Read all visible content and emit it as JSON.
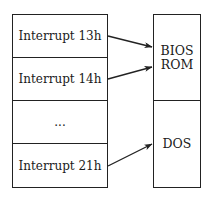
{
  "left_table": {
    "rows": [
      {
        "label": "Interrupt 13h"
      },
      {
        "label": "Interrupt 14h"
      },
      {
        "label": "..."
      },
      {
        "label": "Interrupt 21h"
      }
    ]
  },
  "right_table": {
    "segments": [
      {
        "label": "BIOS\nROM"
      },
      {
        "label": "DOS"
      }
    ]
  },
  "arrows": [
    {
      "from": "Interrupt 13h",
      "to": "BIOS ROM"
    },
    {
      "from": "Interrupt 14h",
      "to": "BIOS ROM"
    },
    {
      "from": "Interrupt 21h",
      "to": "DOS"
    }
  ]
}
